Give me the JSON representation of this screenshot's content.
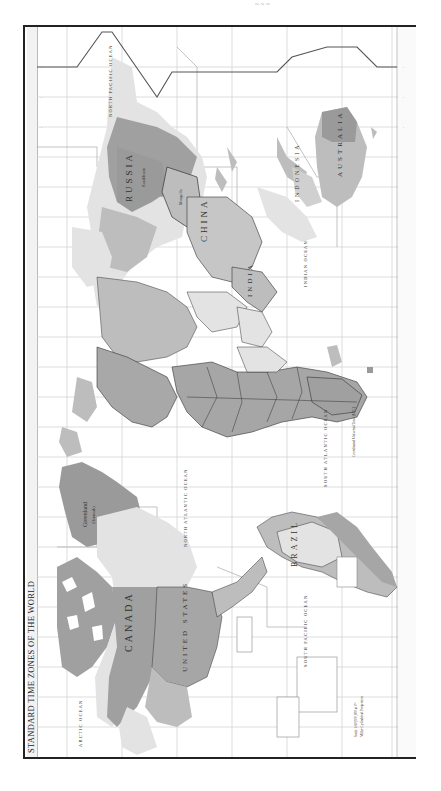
{
  "map": {
    "title": "STANDARD TIME ZONES OF THE WORLD",
    "orientation": "rotated 90° counter-clockwise",
    "scale_note": "Scale 1:80,000,000 at 0°",
    "projection_note": "Miller Cylindrical Projection",
    "legend_title": "Coordinated Universal Time (UTC)",
    "shading": {
      "dark_zone": "#9a9a9a",
      "mid_zone": "#bdbdbd",
      "light_zone": "#e3e3e3",
      "ocean": "#ffffff",
      "grid": "#c8c8c8"
    },
    "labels": {
      "russia": "RUSSIA",
      "china": "CHINA",
      "india": "INDIA",
      "australia": "AUSTRALIA",
      "indonesia": "INDONESIA",
      "canada": "CANADA",
      "united_states": "UNITED STATES",
      "brazil": "BRAZIL",
      "greenland": "Greenland",
      "greenland_sub": "(Denmark)",
      "mongolia": "Mongolia",
      "kazakhstan": "Kazakhstan",
      "north_pacific": "NORTH PACIFIC OCEAN",
      "south_pacific": "SOUTH PACIFIC OCEAN",
      "north_atlantic": "NORTH ATLANTIC OCEAN",
      "south_atlantic": "SOUTH ATLANTIC OCEAN",
      "indian_ocean": "INDIAN OCEAN",
      "arctic_ocean": "ARCTIC OCEAN"
    }
  }
}
